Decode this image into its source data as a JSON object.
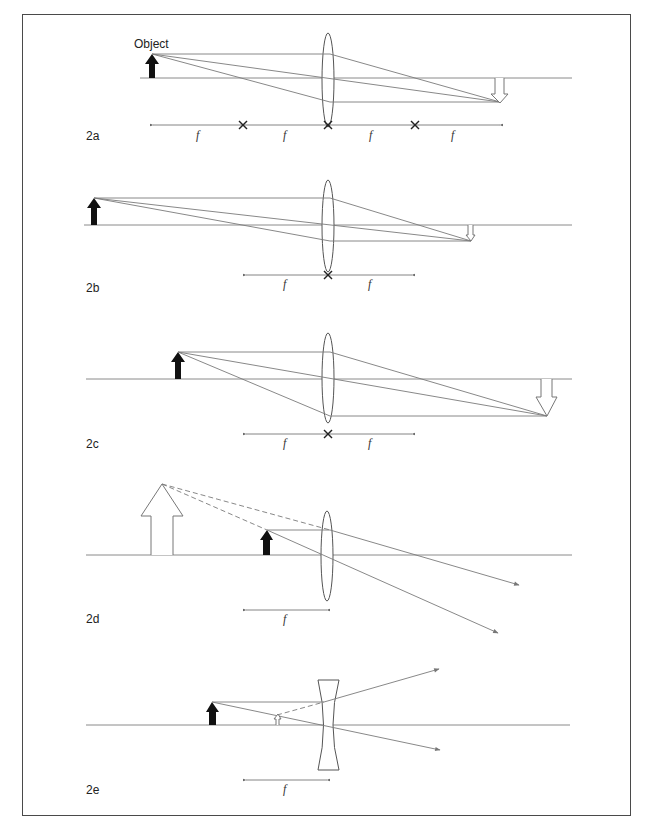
{
  "figure": {
    "object_label": "Object",
    "focal_label": "f",
    "panels": [
      {
        "id": "2a",
        "label": "2a",
        "lens": "convex",
        "f_labels": [
          "f",
          "f",
          "f",
          "f"
        ]
      },
      {
        "id": "2b",
        "label": "2b",
        "lens": "convex",
        "f_labels": [
          "f",
          "f"
        ]
      },
      {
        "id": "2c",
        "label": "2c",
        "lens": "convex",
        "f_labels": [
          "f",
          "f"
        ]
      },
      {
        "id": "2d",
        "label": "2d",
        "lens": "convex",
        "f_labels": [
          "f"
        ]
      },
      {
        "id": "2e",
        "label": "2e",
        "lens": "concave",
        "f_labels": [
          "f"
        ]
      }
    ]
  }
}
